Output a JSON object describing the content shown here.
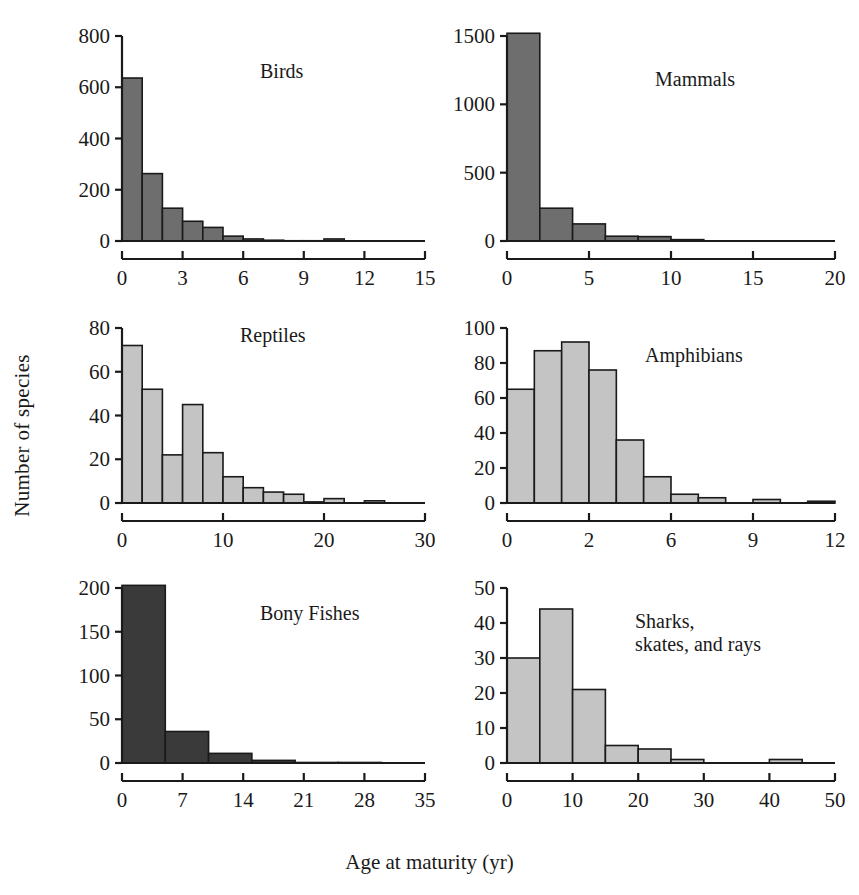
{
  "figure": {
    "xlabel": "Age at maturity (yr)",
    "ylabel": "Number of species"
  },
  "chart_data": [
    {
      "type": "bar",
      "title": "Birds",
      "xlabel": "Age at maturity (yr)",
      "ylabel": "Number of species",
      "xlim": [
        0,
        15
      ],
      "ylim": [
        0,
        800
      ],
      "xticks": [
        0,
        3,
        6,
        9,
        12,
        15
      ],
      "yticks": [
        0,
        200,
        400,
        600,
        800
      ],
      "bin_width": 1,
      "grid": false,
      "bar_color": "#6e6e6e",
      "bin_starts": [
        0,
        1,
        2,
        3,
        4,
        5,
        6,
        7,
        8,
        9,
        10,
        11,
        12,
        13
      ],
      "values": [
        636,
        263,
        128,
        77,
        53,
        19,
        8,
        3,
        1,
        1,
        8,
        0,
        0,
        0
      ],
      "categories": [
        "0-1",
        "1-2",
        "2-3",
        "3-4",
        "4-5",
        "5-6",
        "6-7",
        "7-8",
        "8-9",
        "9-10",
        "10-11",
        "11-12",
        "12-13",
        "13-14"
      ]
    },
    {
      "type": "bar",
      "title": "Mammals",
      "xlabel": "Age at maturity (yr)",
      "ylabel": "Number of species",
      "xlim": [
        0,
        20
      ],
      "ylim": [
        0,
        1500
      ],
      "xticks": [
        0,
        5,
        10,
        15,
        20
      ],
      "yticks": [
        0,
        500,
        1000,
        1500
      ],
      "bin_width": 2,
      "grid": false,
      "bar_color": "#6e6e6e",
      "bin_starts": [
        0,
        2,
        4,
        6,
        8,
        10,
        12,
        14,
        16
      ],
      "values": [
        1520,
        240,
        125,
        35,
        32,
        10,
        0,
        0,
        0
      ],
      "categories": [
        "0-2",
        "2-4",
        "4-6",
        "6-8",
        "8-10",
        "10-12",
        "12-14",
        "14-16",
        "16-18"
      ]
    },
    {
      "type": "bar",
      "title": "Reptiles",
      "xlabel": "Age at maturity (yr)",
      "ylabel": "Number of species",
      "xlim": [
        0,
        30
      ],
      "ylim": [
        0,
        80
      ],
      "xticks": [
        0,
        10,
        20,
        30
      ],
      "yticks": [
        0,
        20,
        40,
        60,
        80
      ],
      "bin_width": 2,
      "grid": false,
      "bar_color": "#c4c4c4",
      "bin_starts": [
        0,
        2,
        4,
        6,
        8,
        10,
        12,
        14,
        16,
        18,
        20,
        24
      ],
      "values": [
        72,
        52,
        22,
        45,
        23,
        12,
        7,
        5,
        4,
        0.5,
        2,
        1
      ],
      "categories": [
        "0-2",
        "2-4",
        "4-6",
        "6-8",
        "8-10",
        "10-12",
        "12-14",
        "14-16",
        "16-18",
        "18-20",
        "20-22",
        "24-26"
      ]
    },
    {
      "type": "bar",
      "title": "Amphibians",
      "xlabel": "Age at maturity (yr)",
      "ylabel": "Number of species",
      "xlim": [
        0,
        12
      ],
      "ylim": [
        0,
        100
      ],
      "xticks": [
        0,
        2,
        6,
        9,
        12
      ],
      "yticks": [
        0,
        20,
        40,
        60,
        80,
        100
      ],
      "bin_width": 1,
      "grid": false,
      "bar_color": "#c4c4c4",
      "bin_starts": [
        0,
        1,
        2,
        3,
        4,
        5,
        6,
        7,
        8,
        9,
        10,
        11
      ],
      "values": [
        65,
        87,
        92,
        76,
        36,
        15,
        5,
        3,
        0,
        2,
        0,
        1
      ],
      "categories": [
        "0-1",
        "1-2",
        "2-3",
        "3-4",
        "4-5",
        "5-6",
        "6-7",
        "7-8",
        "8-9",
        "9-10",
        "10-11",
        "11-12"
      ]
    },
    {
      "type": "bar",
      "title": "Bony Fishes",
      "xlabel": "Age at maturity (yr)",
      "ylabel": "Number of species",
      "xlim": [
        0,
        35
      ],
      "ylim": [
        0,
        200
      ],
      "xticks": [
        0,
        7,
        14,
        21,
        28,
        35
      ],
      "yticks": [
        0,
        50,
        100,
        150,
        200
      ],
      "bin_width": 5,
      "grid": false,
      "bar_color": "#3a3a3a",
      "bin_starts": [
        0,
        5,
        10,
        15,
        20,
        25,
        30
      ],
      "values": [
        203,
        36,
        11,
        3,
        0.6,
        0.6,
        0
      ],
      "categories": [
        "0-5",
        "5-10",
        "10-15",
        "15-20",
        "20-25",
        "25-30",
        "30-35"
      ]
    },
    {
      "type": "bar",
      "title": "Sharks,\nskates, and rays",
      "xlabel": "Age at maturity (yr)",
      "ylabel": "Number of species",
      "xlim": [
        0,
        50
      ],
      "ylim": [
        0,
        50
      ],
      "xticks": [
        0,
        10,
        20,
        30,
        40,
        50
      ],
      "yticks": [
        0,
        10,
        20,
        30,
        40,
        50
      ],
      "bin_width": 5,
      "grid": false,
      "bar_color": "#c4c4c4",
      "bin_starts": [
        0,
        5,
        10,
        15,
        20,
        25,
        30,
        35,
        40
      ],
      "values": [
        30,
        44,
        21,
        5,
        4,
        1,
        0,
        0,
        1
      ],
      "categories": [
        "0-5",
        "5-10",
        "10-15",
        "15-20",
        "20-25",
        "25-30",
        "30-35",
        "35-40",
        "40-45"
      ]
    }
  ],
  "panel_layout": [
    {
      "key": "birds",
      "left": 60,
      "top": 20,
      "width": 375,
      "height": 275,
      "title_x": 200,
      "title_y": 40
    },
    {
      "key": "mammals",
      "left": 445,
      "top": 20,
      "width": 400,
      "height": 275,
      "title_x": 210,
      "title_y": 48
    },
    {
      "key": "reptiles",
      "left": 60,
      "top": 312,
      "width": 375,
      "height": 245,
      "title_x": 180,
      "title_y": 12
    },
    {
      "key": "amphibians",
      "left": 445,
      "top": 312,
      "width": 400,
      "height": 245,
      "title_x": 200,
      "title_y": 32
    },
    {
      "key": "bonyfishes",
      "left": 60,
      "top": 572,
      "width": 375,
      "height": 245,
      "title_x": 200,
      "title_y": 30
    },
    {
      "key": "sharks",
      "left": 445,
      "top": 572,
      "width": 400,
      "height": 245,
      "title_x": 190,
      "title_y": 38
    }
  ]
}
